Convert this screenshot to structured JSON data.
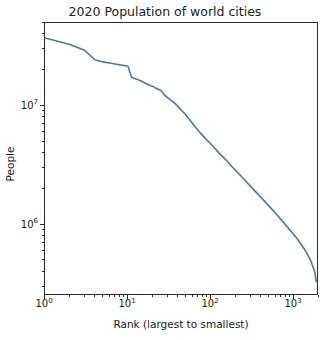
{
  "chart_data": {
    "type": "line",
    "title": "2020 Population of world cities",
    "xlabel": "Rank (largest to smallest)",
    "ylabel": "People",
    "xscale": "log",
    "yscale": "log",
    "xlim": [
      1,
      2000
    ],
    "ylim": [
      250000,
      50000000
    ],
    "grid": false,
    "legend": null,
    "line_color": "#4878a8",
    "background_color": "#ffffff",
    "axis_color": "#2b2b2b",
    "x_major_ticks": [
      "10^0",
      "10^1",
      "10^2",
      "10^3"
    ],
    "x_major_tick_values": [
      1,
      10,
      100,
      1000
    ],
    "y_major_ticks": [
      "10^7",
      "10^6"
    ],
    "y_major_tick_values": [
      10000000,
      1000000
    ],
    "series": [
      {
        "name": "City population by rank",
        "x": [
          1,
          2,
          3,
          4,
          5,
          6,
          7,
          8,
          9,
          10,
          11,
          12,
          13,
          14,
          15,
          16,
          18,
          20,
          22,
          25,
          28,
          31,
          35,
          39,
          44,
          49,
          55,
          62,
          70,
          78,
          88,
          99,
          111,
          125,
          140,
          158,
          177,
          199,
          224,
          251,
          282,
          316,
          355,
          398,
          447,
          501,
          562,
          631,
          708,
          794,
          891,
          1000,
          1122,
          1259,
          1413,
          1585,
          1778,
          1850
        ],
        "y": [
          37400000,
          33000000,
          29400000,
          24500000,
          23500000,
          23000000,
          22600000,
          22200000,
          21900000,
          21600000,
          17500000,
          17000000,
          16700000,
          16400000,
          16000000,
          15600000,
          15000000,
          14600000,
          14000000,
          13500000,
          12200000,
          11500000,
          10800000,
          10100000,
          9200000,
          8500000,
          7700000,
          6900000,
          6200000,
          5700000,
          5200000,
          4800000,
          4400000,
          4000000,
          3700000,
          3400000,
          3100000,
          2850000,
          2620000,
          2400000,
          2200000,
          2020000,
          1850000,
          1700000,
          1560000,
          1430000,
          1310000,
          1200000,
          1090000,
          990000,
          900000,
          820000,
          740000,
          660000,
          580000,
          500000,
          400000,
          330000
        ]
      }
    ]
  },
  "axes": {
    "x_ticks": [
      {
        "label_html": "10<sup>0</sup>",
        "value": 1
      },
      {
        "label_html": "10<sup>1</sup>",
        "value": 10
      },
      {
        "label_html": "10<sup>2</sup>",
        "value": 100
      },
      {
        "label_html": "10<sup>3</sup>",
        "value": 1000
      }
    ],
    "y_ticks": [
      {
        "label_html": "10<sup>7</sup>",
        "value": 10000000
      },
      {
        "label_html": "10<sup>6</sup>",
        "value": 1000000
      }
    ]
  }
}
